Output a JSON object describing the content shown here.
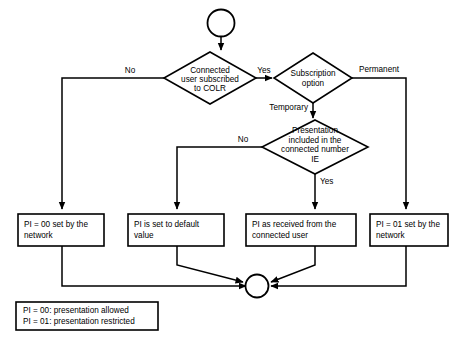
{
  "diagram": {
    "type": "flowchart",
    "colors": {
      "background": "#ffffff",
      "stroke": "#000000",
      "shape_fill": "#ffffff"
    },
    "start_node": {
      "name": "start",
      "shape": "circle"
    },
    "end_node": {
      "name": "end-junction",
      "shape": "circle"
    },
    "decisions": [
      {
        "id": "d1",
        "lines": [
          "Connected",
          "user subscribed",
          "to COLR"
        ]
      },
      {
        "id": "d2",
        "lines": [
          "Subscription",
          "option"
        ]
      },
      {
        "id": "d3",
        "lines": [
          "Presentation",
          "included in the",
          "connected number",
          "IE"
        ]
      }
    ],
    "processes": [
      {
        "id": "p1",
        "lines": [
          "PI = 00 set by the",
          "network"
        ]
      },
      {
        "id": "p2",
        "lines": [
          "PI is set to default",
          "value"
        ]
      },
      {
        "id": "p3",
        "lines": [
          "PI as received from the",
          "connected user"
        ]
      },
      {
        "id": "p4",
        "lines": [
          "PI = 01 set by the",
          "network"
        ]
      }
    ],
    "edge_labels": {
      "d1_no": "No",
      "d1_yes": "Yes",
      "d2_permanent": "Permanent",
      "d2_temporary": "Temporary",
      "d3_no": "No",
      "d3_yes": "Yes"
    },
    "legend": {
      "lines": [
        "PI = 00: presentation allowed",
        "PI = 01: presentation restricted"
      ]
    }
  }
}
